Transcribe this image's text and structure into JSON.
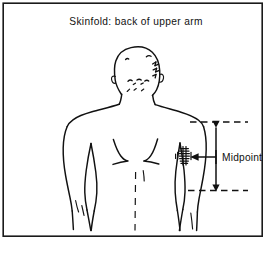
{
  "figure": {
    "title": "Skinfold: back of upper arm",
    "subject_description": "Rear view line drawing of a human upper body with arms at sides",
    "frame": {
      "border_color": "#1a1a1a",
      "background_color": "#ffffff"
    },
    "ink_color": "#111111"
  },
  "annotations": {
    "midpoint_label": "Midpoint",
    "measurement": {
      "top_guide_label": "acromion level guide line",
      "bottom_guide_label": "olecranon level guide line",
      "vertical_arrow_label": "upper arm length double arrow",
      "pointer_label": "midpoint pointer arrow"
    },
    "skinfold_site_label": "skinfold pinch site on back of upper arm"
  },
  "figure_parts": {
    "head": "head-rear-view",
    "neck": "neck",
    "shoulders": "shoulders",
    "torso": "back-torso",
    "left_arm": "left-arm",
    "right_arm": "right-arm",
    "scapula_left": "left-shoulder-blade",
    "scapula_right": "right-shoulder-blade",
    "spine": "spine-midline"
  }
}
